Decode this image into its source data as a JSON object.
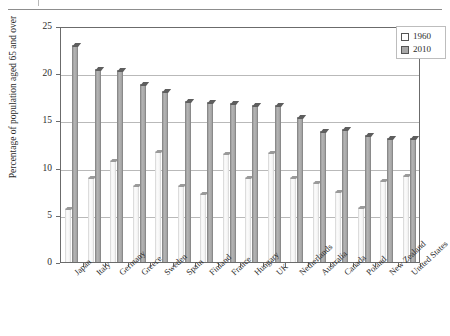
{
  "figure": {
    "y_axis_title": "Percentage of population aged 65 and over",
    "y_ticks": [
      "0",
      "5",
      "10",
      "15",
      "20",
      "25"
    ]
  },
  "legend": {
    "items": [
      {
        "label": "1960",
        "swatch": "hollow-square-icon"
      },
      {
        "label": "2010",
        "swatch": "filled-square-icon"
      }
    ]
  },
  "chart_data": {
    "type": "bar",
    "title": "",
    "xlabel": "",
    "ylabel": "Percentage of population aged 65 and over",
    "ylim": [
      0,
      25
    ],
    "yticks": [
      0,
      5,
      10,
      15,
      20,
      25
    ],
    "grid": true,
    "legend_position": "top-right",
    "categories": [
      "Japan",
      "Italy",
      "Germany",
      "Greece",
      "Sweden",
      "Spain",
      "Finland",
      "France",
      "Hungary",
      "UK",
      "Netherlands",
      "Australia",
      "Canada",
      "Poland",
      "New Zealand",
      "United States"
    ],
    "series": [
      {
        "name": "1960",
        "values": [
          5.7,
          9.0,
          10.8,
          8.2,
          11.8,
          8.2,
          7.3,
          11.6,
          9.0,
          11.7,
          9.0,
          8.5,
          7.5,
          5.8,
          8.7,
          9.2
        ]
      },
      {
        "name": "2010",
        "values": [
          23.0,
          20.4,
          20.3,
          18.9,
          18.1,
          17.1,
          17.0,
          16.8,
          16.6,
          16.6,
          15.4,
          13.9,
          14.1,
          13.5,
          13.1,
          13.1
        ]
      }
    ]
  }
}
